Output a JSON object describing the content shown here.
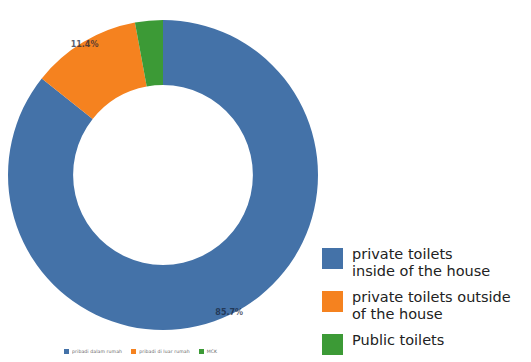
{
  "chart_data": {
    "type": "pie",
    "variant": "donut",
    "title": "",
    "subtitle": "",
    "xlabel": "",
    "ylabel": "",
    "categories": [
      "pribadi dalam rumah",
      "pribadi di luar rumah",
      "MCK"
    ],
    "categories_en": [
      "private toilets inside of the house",
      "private toilets outside of the house",
      "Public toilets"
    ],
    "values": [
      85.7,
      11.4,
      2.9
    ],
    "value_labels": [
      "85.7%",
      "11.4%",
      ""
    ],
    "colors": [
      "#4472a8",
      "#f5821f",
      "#3c9a36"
    ],
    "units": "percent",
    "total": 100,
    "start_angle_deg": 0,
    "direction": "clockwise",
    "inner_radius_ratio": 0.58,
    "legend_position": "right and bottom",
    "grid": false
  },
  "slice_labels": [
    {
      "text": "85.7%"
    },
    {
      "text": "11.4%"
    }
  ],
  "bottom_legend": {
    "items": [
      {
        "label": "pribadi dalam rumah",
        "color": "#4472a8"
      },
      {
        "label": "pribadi di luar rumah",
        "color": "#f5821f"
      },
      {
        "label": "MCK",
        "color": "#3c9a36"
      }
    ]
  },
  "side_legend": {
    "items": [
      {
        "label": "private toilets\ninside of the house",
        "color": "#4472a8"
      },
      {
        "label": "private toilets outside\nof the house",
        "color": "#f5821f"
      },
      {
        "label": "Public toilets",
        "color": "#3c9a36"
      }
    ]
  }
}
